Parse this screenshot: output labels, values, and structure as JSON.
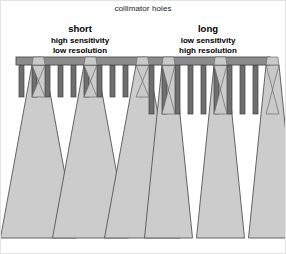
{
  "figure": {
    "title": "collimator holes"
  },
  "labels": {
    "left": {
      "heading": "short",
      "line1": "high sensitivity",
      "line2": "low resolution"
    },
    "right": {
      "heading": "long",
      "line1": "low sensitivity",
      "line2": "high resolution"
    }
  },
  "colors": {
    "background": "#ffffff",
    "plate_fill": "#8c8c8c",
    "plate_stroke": "#4d4d4d",
    "septum_fill": "#6e6e6e",
    "septum_stroke": "#3f3f3f",
    "cone_fill": "#cccccc",
    "cone_stroke": "#555555",
    "bowtie_fill": "#c9c9c9",
    "bowtie_stroke": "#6b6b6b",
    "text": "#000000",
    "frame": "#e3e3e3"
  },
  "geometry": {
    "plate": {
      "x": 16,
      "y": 57,
      "width": 254,
      "height": 8
    },
    "septum_top": 65,
    "septum_width": 5,
    "left_septum_bottom": 97,
    "right_septum_bottom": 114,
    "cone_clip_bottom": 238,
    "left_septa_x": [
      19,
      32,
      45,
      58,
      71,
      84,
      97,
      110,
      123
    ],
    "right_septa_x": [
      149,
      162,
      175,
      188,
      201,
      214,
      227,
      240,
      253
    ],
    "left_holes": [
      {
        "apex_x": 38.5,
        "half_width_top": 6.5,
        "base_half_width": 38,
        "base_y": 238
      },
      {
        "apex_x": 90.5,
        "half_width_top": 6.5,
        "base_half_width": 38,
        "base_y": 238
      },
      {
        "apex_x": 142.5,
        "half_width_top": 6.5,
        "base_half_width": 38,
        "base_y": 238
      }
    ],
    "right_holes": [
      {
        "apex_x": 168.5,
        "half_width_top": 6.5,
        "base_half_width": 24,
        "base_y": 238
      },
      {
        "apex_x": 220.5,
        "half_width_top": 6.5,
        "base_half_width": 24,
        "base_y": 238
      },
      {
        "apex_x": 272.5,
        "half_width_top": 6.5,
        "base_half_width": 24,
        "base_y": 238
      }
    ]
  },
  "chart_data": {
    "type": "diagram",
    "title": "collimator holes",
    "comparison": [
      {
        "side": "left",
        "hole_length": "short",
        "sensitivity": "high sensitivity",
        "resolution": "low resolution",
        "septa_length_px": 32,
        "acceptance_cone_base_width_px": 76,
        "hole_count": 3,
        "septa_count": 9
      },
      {
        "side": "right",
        "hole_length": "long",
        "sensitivity": "low sensitivity",
        "resolution": "high resolution",
        "septa_length_px": 49,
        "acceptance_cone_base_width_px": 48,
        "hole_count": 3,
        "septa_count": 9
      }
    ]
  }
}
